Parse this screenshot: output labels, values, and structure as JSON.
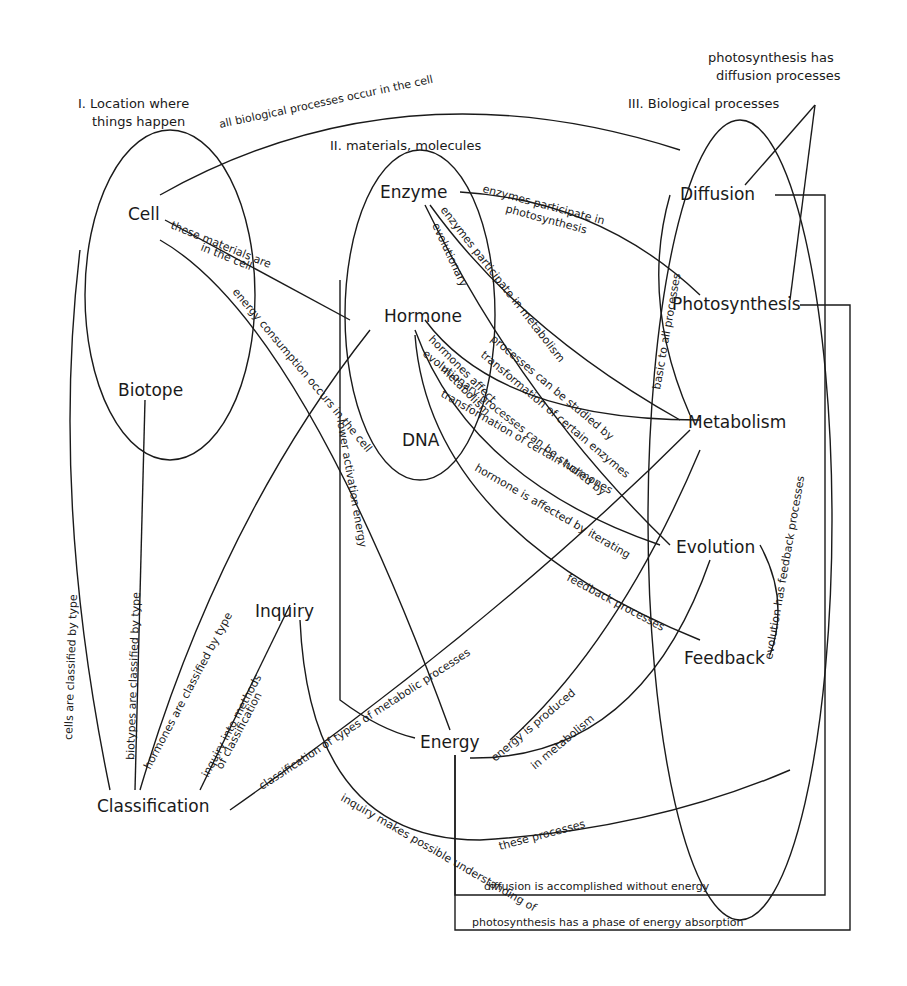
{
  "regions": {
    "location": "I. Location where things happen",
    "location_l1": "I. Location where",
    "location_l2": "things happen",
    "materials": "II. materials, molecules",
    "processes": "III. Biological processes"
  },
  "nodes": {
    "cell": "Cell",
    "biotope": "Biotope",
    "enzyme": "Enzyme",
    "hormone": "Hormone",
    "dna": "DNA",
    "diffusion": "Diffusion",
    "photosynthesis": "Photosynthesis",
    "metabolism": "Metabolism",
    "evolution": "Evolution",
    "feedback": "Feedback",
    "inquiry": "Inquiry",
    "energy": "Energy",
    "classification": "Classification"
  },
  "links": {
    "all_processes_in_cell": "all biological processes occur in the cell",
    "materials_in_cell_1": "these materials are",
    "materials_in_cell_2": "in the cell",
    "energy_consumption": "energy consumption occurs in the cell",
    "enzymes_photosynthesis_1": "enzymes participate in",
    "enzymes_photosynthesis_2": "photosynthesis",
    "enzymes_metabolism": "enzymes participate in metabolism",
    "enzymes_evolutionary": "evolutionary",
    "photosynthesis_diffusion_1": "photosynthesis has",
    "photosynthesis_diffusion_2": "diffusion processes",
    "diffusion_photosynthesis_metabolism": "basic to all processes",
    "hormones_metabolism_1": "hormones affect",
    "hormones_metabolism_2": "metabolism",
    "processes_transformation_1": "processes can be studied by",
    "processes_transformation_2": "transformation of certain enzymes",
    "evolutionary_hormones_1": "evolutionary processes can be studied by",
    "evolutionary_hormones_2": "transformation of certain hormones",
    "hormone_feedback_1": "hormone is affected by iterating",
    "hormone_feedback_2": "feedback processes",
    "evolution_feedback": "evolution has feedback processes",
    "cells_classified": "cells are classified by type",
    "biotypes_classified": "biotypes are classified by type",
    "hormones_classified": "hormones are classified by type",
    "inquiry_classification_1": "inquiry into methods",
    "inquiry_classification_2": "of classification",
    "classification_metabolic": "classification of types of metabolic processes",
    "energy_metabolism_1": "energy is produced",
    "energy_metabolism_2": "in metabolism",
    "inquiry_understanding_1": "inquiry makes possible understanding of",
    "inquiry_understanding_2": "these processes",
    "lower_activation": "lower activation energy",
    "diffusion_no_energy": "diffusion is accomplished without energy",
    "photosynthesis_absorption": "photosynthesis has a phase of energy absorption"
  }
}
